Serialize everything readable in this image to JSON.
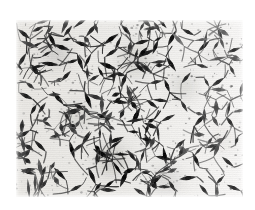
{
  "figure": {
    "kind": "photomicrograph",
    "stain_tone": "grayscale",
    "background_color": "#f2f1ee",
    "cell_color": "#1a1a1a",
    "page_color": "#ffffff",
    "caption": "",
    "frame": {
      "x": 16,
      "y": 20,
      "width": 227,
      "height": 177
    }
  },
  "chart_data": {
    "type": "heatmap",
    "title": "",
    "xlabel": "",
    "ylabel": "",
    "grid": false,
    "legend": "none",
    "xlim": [
      0,
      227
    ],
    "ylim": [
      0,
      177
    ],
    "colorscale": [
      "#f6f5f2",
      "#cfcdc8",
      "#7b7975",
      "#2a2a28",
      "#111111"
    ],
    "regions": [
      {
        "name": "upper-left",
        "density": 0.72,
        "mean_gray": 0.58
      },
      {
        "name": "upper-center",
        "density": 0.8,
        "mean_gray": 0.55
      },
      {
        "name": "upper-right",
        "density": 0.34,
        "mean_gray": 0.82
      },
      {
        "name": "mid-left",
        "density": 0.68,
        "mean_gray": 0.62
      },
      {
        "name": "mid-center",
        "density": 0.78,
        "mean_gray": 0.57
      },
      {
        "name": "mid-right",
        "density": 0.4,
        "mean_gray": 0.78
      },
      {
        "name": "lower-left",
        "density": 0.6,
        "mean_gray": 0.66
      },
      {
        "name": "lower-center",
        "density": 0.84,
        "mean_gray": 0.52
      },
      {
        "name": "lower-right",
        "density": 0.46,
        "mean_gray": 0.74
      }
    ],
    "cells": [
      {
        "x": 8,
        "y": 14,
        "len": 16,
        "w": 4.0,
        "ang": 38,
        "g": 0.16
      },
      {
        "x": 22,
        "y": 9,
        "len": 13,
        "w": 3.4,
        "ang": -24,
        "g": 0.22
      },
      {
        "x": 36,
        "y": 20,
        "len": 18,
        "w": 4.2,
        "ang": 64,
        "g": 0.12
      },
      {
        "x": 52,
        "y": 11,
        "len": 14,
        "w": 3.6,
        "ang": -52,
        "g": 0.2
      },
      {
        "x": 66,
        "y": 24,
        "len": 17,
        "w": 4.0,
        "ang": 18,
        "g": 0.14
      },
      {
        "x": 80,
        "y": 8,
        "len": 12,
        "w": 3.2,
        "ang": 72,
        "g": 0.26
      },
      {
        "x": 95,
        "y": 19,
        "len": 19,
        "w": 4.4,
        "ang": -36,
        "g": 0.1
      },
      {
        "x": 110,
        "y": 10,
        "len": 15,
        "w": 3.8,
        "ang": 48,
        "g": 0.18
      },
      {
        "x": 126,
        "y": 22,
        "len": 16,
        "w": 4.0,
        "ang": -14,
        "g": 0.15
      },
      {
        "x": 141,
        "y": 7,
        "len": 13,
        "w": 3.4,
        "ang": 58,
        "g": 0.24
      },
      {
        "x": 156,
        "y": 18,
        "len": 18,
        "w": 4.2,
        "ang": -62,
        "g": 0.13
      },
      {
        "x": 172,
        "y": 12,
        "len": 14,
        "w": 3.6,
        "ang": 28,
        "g": 0.21
      },
      {
        "x": 188,
        "y": 26,
        "len": 16,
        "w": 3.8,
        "ang": -44,
        "g": 0.19
      },
      {
        "x": 204,
        "y": 14,
        "len": 12,
        "w": 3.2,
        "ang": 66,
        "g": 0.3
      },
      {
        "x": 218,
        "y": 30,
        "len": 15,
        "w": 3.6,
        "ang": -20,
        "g": 0.25
      },
      {
        "x": 6,
        "y": 40,
        "len": 17,
        "w": 4.0,
        "ang": -58,
        "g": 0.15
      },
      {
        "x": 20,
        "y": 52,
        "len": 14,
        "w": 3.6,
        "ang": 34,
        "g": 0.2
      },
      {
        "x": 34,
        "y": 44,
        "len": 19,
        "w": 4.4,
        "ang": 8,
        "g": 0.11
      },
      {
        "x": 50,
        "y": 56,
        "len": 15,
        "w": 3.8,
        "ang": -46,
        "g": 0.18
      },
      {
        "x": 64,
        "y": 42,
        "len": 18,
        "w": 4.2,
        "ang": 70,
        "g": 0.13
      },
      {
        "x": 78,
        "y": 58,
        "len": 13,
        "w": 3.4,
        "ang": -30,
        "g": 0.23
      },
      {
        "x": 92,
        "y": 46,
        "len": 20,
        "w": 4.6,
        "ang": 22,
        "g": 0.09
      },
      {
        "x": 108,
        "y": 60,
        "len": 16,
        "w": 4.0,
        "ang": -68,
        "g": 0.16
      },
      {
        "x": 124,
        "y": 48,
        "len": 17,
        "w": 4.0,
        "ang": 42,
        "g": 0.14
      },
      {
        "x": 140,
        "y": 62,
        "len": 14,
        "w": 3.6,
        "ang": -12,
        "g": 0.21
      },
      {
        "x": 155,
        "y": 44,
        "len": 18,
        "w": 4.2,
        "ang": 56,
        "g": 0.12
      },
      {
        "x": 170,
        "y": 58,
        "len": 15,
        "w": 3.6,
        "ang": -50,
        "g": 0.22
      },
      {
        "x": 186,
        "y": 46,
        "len": 13,
        "w": 3.2,
        "ang": 16,
        "g": 0.28
      },
      {
        "x": 202,
        "y": 62,
        "len": 16,
        "w": 3.8,
        "ang": -34,
        "g": 0.24
      },
      {
        "x": 216,
        "y": 50,
        "len": 12,
        "w": 3.0,
        "ang": 62,
        "g": 0.32
      },
      {
        "x": 10,
        "y": 76,
        "len": 16,
        "w": 4.0,
        "ang": 26,
        "g": 0.17
      },
      {
        "x": 26,
        "y": 88,
        "len": 14,
        "w": 3.6,
        "ang": -56,
        "g": 0.2
      },
      {
        "x": 42,
        "y": 78,
        "len": 18,
        "w": 4.2,
        "ang": 50,
        "g": 0.12
      },
      {
        "x": 58,
        "y": 92,
        "len": 15,
        "w": 3.8,
        "ang": -18,
        "g": 0.19
      },
      {
        "x": 72,
        "y": 80,
        "len": 19,
        "w": 4.4,
        "ang": 68,
        "g": 0.1
      },
      {
        "x": 88,
        "y": 94,
        "len": 13,
        "w": 3.4,
        "ang": -40,
        "g": 0.23
      },
      {
        "x": 104,
        "y": 82,
        "len": 17,
        "w": 4.0,
        "ang": 6,
        "g": 0.14
      },
      {
        "x": 120,
        "y": 96,
        "len": 20,
        "w": 4.6,
        "ang": -64,
        "g": 0.08
      },
      {
        "x": 136,
        "y": 84,
        "len": 15,
        "w": 3.8,
        "ang": 36,
        "g": 0.18
      },
      {
        "x": 152,
        "y": 98,
        "len": 16,
        "w": 3.8,
        "ang": -26,
        "g": 0.2
      },
      {
        "x": 168,
        "y": 86,
        "len": 14,
        "w": 3.4,
        "ang": 60,
        "g": 0.25
      },
      {
        "x": 184,
        "y": 100,
        "len": 17,
        "w": 4.0,
        "ang": -48,
        "g": 0.21
      },
      {
        "x": 200,
        "y": 88,
        "len": 12,
        "w": 3.0,
        "ang": 14,
        "g": 0.33
      },
      {
        "x": 214,
        "y": 102,
        "len": 15,
        "w": 3.6,
        "ang": 54,
        "g": 0.26
      },
      {
        "x": 8,
        "y": 114,
        "len": 15,
        "w": 3.8,
        "ang": -32,
        "g": 0.19
      },
      {
        "x": 24,
        "y": 126,
        "len": 17,
        "w": 4.0,
        "ang": 44,
        "g": 0.15
      },
      {
        "x": 40,
        "y": 116,
        "len": 13,
        "w": 3.4,
        "ang": -10,
        "g": 0.24
      },
      {
        "x": 56,
        "y": 130,
        "len": 19,
        "w": 4.4,
        "ang": 74,
        "g": 0.1
      },
      {
        "x": 70,
        "y": 118,
        "len": 16,
        "w": 4.0,
        "ang": -60,
        "g": 0.16
      },
      {
        "x": 86,
        "y": 134,
        "len": 21,
        "w": 4.8,
        "ang": 30,
        "g": 0.07
      },
      {
        "x": 100,
        "y": 120,
        "len": 18,
        "w": 4.2,
        "ang": -22,
        "g": 0.13
      },
      {
        "x": 116,
        "y": 136,
        "len": 16,
        "w": 3.8,
        "ang": 52,
        "g": 0.17
      },
      {
        "x": 132,
        "y": 122,
        "len": 14,
        "w": 3.6,
        "ang": -70,
        "g": 0.22
      },
      {
        "x": 148,
        "y": 138,
        "len": 18,
        "w": 4.2,
        "ang": 12,
        "g": 0.14
      },
      {
        "x": 164,
        "y": 124,
        "len": 15,
        "w": 3.6,
        "ang": -42,
        "g": 0.23
      },
      {
        "x": 180,
        "y": 140,
        "len": 17,
        "w": 4.0,
        "ang": 64,
        "g": 0.18
      },
      {
        "x": 196,
        "y": 126,
        "len": 13,
        "w": 3.2,
        "ang": -16,
        "g": 0.29
      },
      {
        "x": 212,
        "y": 142,
        "len": 16,
        "w": 3.8,
        "ang": 40,
        "g": 0.24
      },
      {
        "x": 12,
        "y": 152,
        "len": 16,
        "w": 4.0,
        "ang": 20,
        "g": 0.18
      },
      {
        "x": 28,
        "y": 164,
        "len": 13,
        "w": 3.4,
        "ang": -54,
        "g": 0.25
      },
      {
        "x": 44,
        "y": 154,
        "len": 18,
        "w": 4.2,
        "ang": 46,
        "g": 0.13
      },
      {
        "x": 60,
        "y": 168,
        "len": 15,
        "w": 3.8,
        "ang": -28,
        "g": 0.2
      },
      {
        "x": 76,
        "y": 156,
        "len": 19,
        "w": 4.4,
        "ang": 66,
        "g": 0.11
      },
      {
        "x": 92,
        "y": 170,
        "len": 17,
        "w": 4.0,
        "ang": 4,
        "g": 0.16
      },
      {
        "x": 108,
        "y": 158,
        "len": 20,
        "w": 4.6,
        "ang": -66,
        "g": 0.09
      },
      {
        "x": 124,
        "y": 172,
        "len": 15,
        "w": 3.8,
        "ang": 32,
        "g": 0.19
      },
      {
        "x": 140,
        "y": 160,
        "len": 17,
        "w": 4.0,
        "ang": -38,
        "g": 0.15
      },
      {
        "x": 156,
        "y": 166,
        "len": 14,
        "w": 3.6,
        "ang": 58,
        "g": 0.22
      },
      {
        "x": 172,
        "y": 158,
        "len": 18,
        "w": 4.2,
        "ang": -8,
        "g": 0.17
      },
      {
        "x": 188,
        "y": 170,
        "len": 15,
        "w": 3.6,
        "ang": 50,
        "g": 0.23
      },
      {
        "x": 204,
        "y": 160,
        "len": 13,
        "w": 3.2,
        "ang": -46,
        "g": 0.27
      },
      {
        "x": 218,
        "y": 168,
        "len": 16,
        "w": 3.8,
        "ang": 24,
        "g": 0.21
      }
    ],
    "clusters": [
      {
        "x": 96,
        "y": 140,
        "r": 26,
        "strength": 0.55
      },
      {
        "x": 40,
        "y": 34,
        "r": 24,
        "strength": 0.42
      },
      {
        "x": 120,
        "y": 40,
        "r": 26,
        "strength": 0.46
      },
      {
        "x": 168,
        "y": 66,
        "r": 22,
        "strength": 0.38
      },
      {
        "x": 62,
        "y": 96,
        "r": 22,
        "strength": 0.36
      },
      {
        "x": 150,
        "y": 160,
        "r": 24,
        "strength": 0.34
      },
      {
        "x": 200,
        "y": 36,
        "r": 20,
        "strength": 0.14
      },
      {
        "x": 206,
        "y": 120,
        "r": 20,
        "strength": 0.16
      }
    ]
  }
}
